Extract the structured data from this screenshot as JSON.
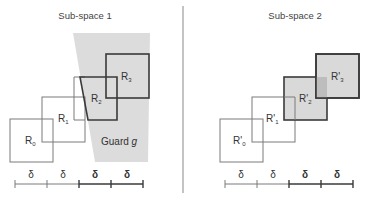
{
  "panels": [
    {
      "title": "Sub-space 1",
      "guard_label": "Guard ",
      "guard_var": "g",
      "regions": [
        {
          "name": "R",
          "sub": "0"
        },
        {
          "name": "R",
          "sub": "1"
        },
        {
          "name": "R",
          "sub": "2"
        },
        {
          "name": "R",
          "sub": "3"
        }
      ],
      "scale": [
        "δ",
        "δ",
        "δ",
        "δ"
      ]
    },
    {
      "title": "Sub-space 2",
      "regions": [
        {
          "name": "R'",
          "sub": "0"
        },
        {
          "name": "R'",
          "sub": "1"
        },
        {
          "name": "R'",
          "sub": "2"
        },
        {
          "name": "R'",
          "sub": "3"
        }
      ],
      "scale": [
        "δ",
        "δ",
        "δ",
        "δ"
      ]
    }
  ],
  "colors": {
    "guard_fill": "#dcdcdc",
    "shaded_fill": "#d9d9d9",
    "overlap_fill": "#bdbdbd",
    "thin_stroke": "#7a7a7a",
    "thick_stroke": "#3a3a3a",
    "divider": "#888888"
  }
}
